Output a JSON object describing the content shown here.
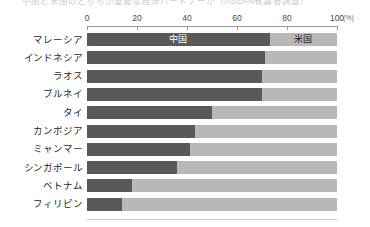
{
  "title_fragment": "中国と米国のどちらが重要な経済パートナーか（ASEAN有識者調査）",
  "axis": {
    "unit": "(%)",
    "ticks": [
      0,
      20,
      40,
      60,
      80,
      100
    ],
    "tick_labels": [
      "0",
      "20",
      "40",
      "60",
      "80",
      "100"
    ],
    "min": 0,
    "max": 100
  },
  "legend": {
    "china_label": "中国",
    "us_label": "米国",
    "china_color": "#595959",
    "us_color": "#b8b8b8"
  },
  "chart_data": {
    "type": "bar",
    "orientation": "horizontal",
    "stacked": true,
    "percent": true,
    "title": "中国と米国のどちらが重要な経済パートナーか（ASEAN有識者調査）",
    "xlabel": "(%)",
    "ylabel": "",
    "xlim": [
      0,
      100
    ],
    "grid": false,
    "legend_position": "inline-first-bar",
    "categories": [
      "マレーシア",
      "インドネシア",
      "ラオス",
      "ブルネイ",
      "タイ",
      "カンボジア",
      "ミャンマー",
      "シンガポール",
      "ベトナム",
      "フィリピン"
    ],
    "series": [
      {
        "name": "中国",
        "color": "#595959",
        "values": [
          73,
          71,
          70,
          70,
          50,
          43,
          41,
          36,
          18,
          14
        ]
      },
      {
        "name": "米国",
        "color": "#b8b8b8",
        "values": [
          27,
          29,
          30,
          30,
          50,
          57,
          59,
          64,
          82,
          86
        ]
      }
    ],
    "annotations": [
      {
        "text": "中国",
        "row": 0,
        "series": "中国"
      },
      {
        "text": "米国",
        "row": 0,
        "series": "米国"
      }
    ]
  }
}
